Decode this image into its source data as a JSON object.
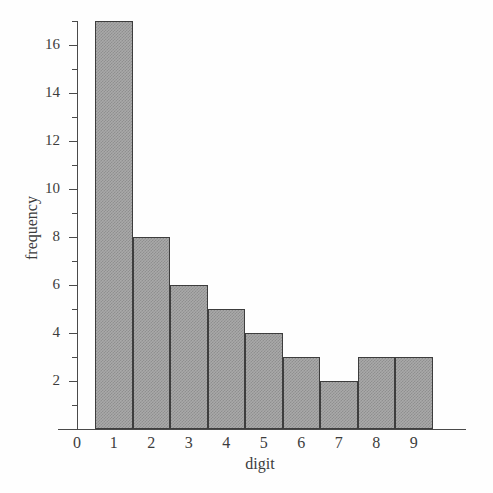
{
  "chart_data": {
    "type": "bar",
    "title": "",
    "xlabel": "digit",
    "ylabel": "frequency",
    "categories": [
      "1",
      "2",
      "3",
      "4",
      "5",
      "6",
      "7",
      "8",
      "9"
    ],
    "values": [
      17,
      8,
      6,
      5,
      4,
      3,
      2,
      3,
      3
    ],
    "series": [
      {
        "name": "frequency",
        "values": [
          17,
          8,
          6,
          5,
          4,
          3,
          2,
          3,
          3
        ]
      }
    ],
    "xlim": [
      0,
      9.5
    ],
    "ylim": [
      0,
      17
    ],
    "x_tick_labels": [
      "0",
      "1",
      "2",
      "3",
      "4",
      "5",
      "6",
      "7",
      "8",
      "9"
    ],
    "y_tick_labels": [
      "2",
      "4",
      "6",
      "8",
      "10",
      "12",
      "14",
      "16"
    ],
    "y_major_ticks": [
      2,
      4,
      6,
      8,
      10,
      12,
      14,
      16
    ],
    "y_minor_ticks": [
      1,
      3,
      5,
      7,
      9,
      11,
      13,
      15,
      17
    ],
    "grid": false,
    "legend": false,
    "bar_fill_color": "#a9a9a9",
    "bar_edge_color": "#3d3d3d",
    "axis_color": "#4a4a4a",
    "background_color": "#fefefe",
    "bar_width": 1,
    "bars": [
      {
        "digit": "1",
        "frequency": 17
      },
      {
        "digit": "2",
        "frequency": 8
      },
      {
        "digit": "3",
        "frequency": 6
      },
      {
        "digit": "4",
        "frequency": 5
      },
      {
        "digit": "5",
        "frequency": 4
      },
      {
        "digit": "6",
        "frequency": 3
      },
      {
        "digit": "7",
        "frequency": 2
      },
      {
        "digit": "8",
        "frequency": 3
      },
      {
        "digit": "9",
        "frequency": 3
      }
    ]
  }
}
